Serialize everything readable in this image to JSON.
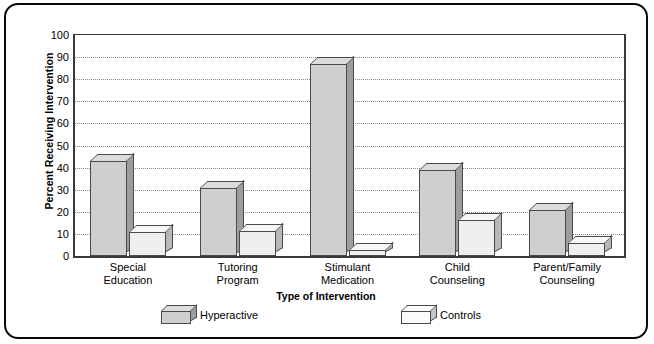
{
  "chart_data": {
    "type": "bar",
    "title": "",
    "xlabel": "Type of Intervention",
    "ylabel": "Percent Receiving Intervention",
    "ylim": [
      0,
      100
    ],
    "ytick_values": [
      0,
      10,
      20,
      30,
      40,
      50,
      60,
      70,
      80,
      90,
      100
    ],
    "ytick_labels": [
      "0",
      "10",
      "20",
      "30",
      "40",
      "50",
      "60",
      "70",
      "80",
      "90",
      "100"
    ],
    "grid": true,
    "legend_position": "bottom",
    "categories": [
      "Special\nEducation",
      "Tutoring\nProgram",
      "Stimulant\nMedication",
      "Child\nCounseling",
      "Parent/Family\nCounseling"
    ],
    "series": [
      {
        "name": "Hyperactive",
        "color": "#cfcfcf",
        "values": [
          43,
          31,
          87,
          39,
          21
        ]
      },
      {
        "name": "Controls",
        "color": "#efefef",
        "values": [
          11,
          11.5,
          2.5,
          16.5,
          6
        ]
      }
    ]
  }
}
